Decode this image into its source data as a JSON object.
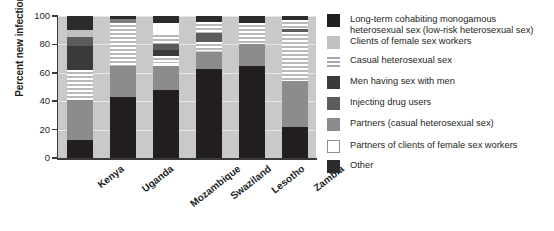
{
  "chart_data": {
    "type": "bar",
    "stacked": true,
    "title": "",
    "subtitle": "",
    "xlabel": "",
    "ylabel": "Percent new infections",
    "ylim": [
      0,
      100
    ],
    "yticks": [
      0,
      20,
      40,
      60,
      80,
      100
    ],
    "ytick_labels": [
      "0",
      "20",
      "40",
      "60",
      "80",
      "100"
    ],
    "grid": true,
    "legend_position": "right",
    "units": "percent",
    "categories": [
      "Kenya",
      "Uganda",
      "Mozambique",
      "Swaziland",
      "Lesotho",
      "Zambia"
    ],
    "series": [
      {
        "name": "Long-term cohabiting monogamous heterosexual sex (low-risk heterosexual sex)",
        "color": "#231f20",
        "pattern": "solid",
        "values": [
          13,
          43,
          48,
          63,
          65,
          22
        ]
      },
      {
        "name": "Partners (casual heterosexual sex)",
        "color": "#8c8c8c",
        "pattern": "solid",
        "values": [
          28,
          22,
          17,
          12,
          15,
          32
        ]
      },
      {
        "name": "Partners of clients of female sex workers",
        "color": "#ffffff",
        "pattern": "solid",
        "values": [
          0,
          0,
          2,
          0,
          0,
          0
        ]
      },
      {
        "name": "Casual heterosexual sex",
        "color": "#b9b9b9",
        "pattern": "horizontal-stripes",
        "values": [
          21,
          30,
          5,
          7,
          15,
          35
        ]
      },
      {
        "name": "Men having sex with men",
        "color": "#3a3a3a",
        "pattern": "solid",
        "values": [
          17,
          0,
          4,
          0,
          0,
          0
        ]
      },
      {
        "name": "Injecting drug users",
        "color": "#5c5c5c",
        "pattern": "solid",
        "values": [
          6,
          3,
          4,
          6,
          0,
          2
        ]
      },
      {
        "name": "Casual heterosexual sex (upper band)",
        "color": "#b9b9b9",
        "pattern": "horizontal-stripes",
        "values": [
          0,
          0,
          8,
          8,
          0,
          6
        ]
      },
      {
        "name": "Partners of clients of female sex workers (upper band)",
        "color": "#ffffff",
        "pattern": "solid",
        "values": [
          0,
          0,
          7,
          0,
          0,
          0
        ]
      },
      {
        "name": "Clients of female sex workers",
        "color": "#c0c0c0",
        "pattern": "solid",
        "values": [
          5,
          0,
          0,
          0,
          0,
          0
        ]
      },
      {
        "name": "Other",
        "color": "#2b2b2b",
        "pattern": "solid",
        "values": [
          10,
          2,
          5,
          4,
          5,
          3
        ]
      }
    ],
    "bars": [
      {
        "category": "Kenya",
        "segments": [
          {
            "key": "other-bottom",
            "label": "Other",
            "from": 0,
            "to": 13,
            "fill": "#231f20"
          },
          {
            "key": "partners-casual",
            "label": "Partners (casual heterosexual sex)",
            "from": 13,
            "to": 41,
            "fill": "#8c8c8c"
          },
          {
            "key": "casual-hetero",
            "label": "Casual heterosexual sex",
            "from": 41,
            "to": 62,
            "fill": "hatch"
          },
          {
            "key": "msm",
            "label": "Men having sex with men",
            "from": 62,
            "to": 79,
            "fill": "#3a3a3a"
          },
          {
            "key": "idu",
            "label": "Injecting drug users",
            "from": 79,
            "to": 85,
            "fill": "#5c5c5c"
          },
          {
            "key": "clients-fsw",
            "label": "Clients of female sex workers",
            "from": 85,
            "to": 90,
            "fill": "#c0c0c0"
          },
          {
            "key": "other-top",
            "label": "Other",
            "from": 90,
            "to": 100,
            "fill": "#2b2b2b"
          }
        ]
      },
      {
        "category": "Uganda",
        "segments": [
          {
            "key": "longterm",
            "label": "Long-term cohabiting monogamous heterosexual sex",
            "from": 0,
            "to": 43,
            "fill": "#231f20"
          },
          {
            "key": "partners-casual",
            "label": "Partners (casual heterosexual sex)",
            "from": 43,
            "to": 65,
            "fill": "#8c8c8c"
          },
          {
            "key": "casual-hetero",
            "label": "Casual heterosexual sex",
            "from": 65,
            "to": 95,
            "fill": "hatch"
          },
          {
            "key": "idu",
            "label": "Injecting drug users",
            "from": 95,
            "to": 98,
            "fill": "#7d7d7d"
          },
          {
            "key": "other-top",
            "label": "Other",
            "from": 98,
            "to": 100,
            "fill": "#2b2b2b"
          }
        ]
      },
      {
        "category": "Mozambique",
        "segments": [
          {
            "key": "longterm",
            "label": "Long-term cohabiting monogamous heterosexual sex",
            "from": 0,
            "to": 48,
            "fill": "#231f20"
          },
          {
            "key": "partners-casual",
            "label": "Partners (casual heterosexual sex)",
            "from": 48,
            "to": 65,
            "fill": "#8c8c8c"
          },
          {
            "key": "partners-clients-fsw",
            "label": "Partners of clients of female sex workers",
            "from": 65,
            "to": 67,
            "fill": "#ffffff"
          },
          {
            "key": "casual-hetero-low",
            "label": "Casual heterosexual sex",
            "from": 67,
            "to": 72,
            "fill": "hatch"
          },
          {
            "key": "msm",
            "label": "Men having sex with men",
            "from": 72,
            "to": 76,
            "fill": "#3a3a3a"
          },
          {
            "key": "idu",
            "label": "Injecting drug users",
            "from": 76,
            "to": 80,
            "fill": "#5c5c5c"
          },
          {
            "key": "casual-hetero-high",
            "label": "Casual heterosexual sex",
            "from": 80,
            "to": 88,
            "fill": "hatch"
          },
          {
            "key": "partners-clients-fsw-high",
            "label": "Partners of clients of female sex workers",
            "from": 88,
            "to": 95,
            "fill": "#ffffff"
          },
          {
            "key": "other-top",
            "label": "Other",
            "from": 95,
            "to": 100,
            "fill": "#2b2b2b"
          }
        ]
      },
      {
        "category": "Swaziland",
        "segments": [
          {
            "key": "longterm",
            "label": "Long-term cohabiting monogamous heterosexual sex",
            "from": 0,
            "to": 63,
            "fill": "#231f20"
          },
          {
            "key": "partners-casual",
            "label": "Partners (casual heterosexual sex)",
            "from": 63,
            "to": 75,
            "fill": "#8c8c8c"
          },
          {
            "key": "casual-hetero-low",
            "label": "Casual heterosexual sex",
            "from": 75,
            "to": 82,
            "fill": "hatch"
          },
          {
            "key": "idu",
            "label": "Injecting drug users",
            "from": 82,
            "to": 88,
            "fill": "#5c5c5c"
          },
          {
            "key": "casual-hetero-high",
            "label": "Casual heterosexual sex",
            "from": 88,
            "to": 96,
            "fill": "hatch"
          },
          {
            "key": "other-top",
            "label": "Other",
            "from": 96,
            "to": 100,
            "fill": "#2b2b2b"
          }
        ]
      },
      {
        "category": "Lesotho",
        "segments": [
          {
            "key": "longterm",
            "label": "Long-term cohabiting monogamous heterosexual sex",
            "from": 0,
            "to": 65,
            "fill": "#231f20"
          },
          {
            "key": "partners-casual",
            "label": "Partners (casual heterosexual sex)",
            "from": 65,
            "to": 80,
            "fill": "#8c8c8c"
          },
          {
            "key": "casual-hetero",
            "label": "Casual heterosexual sex",
            "from": 80,
            "to": 95,
            "fill": "hatch"
          },
          {
            "key": "other-top",
            "label": "Other",
            "from": 95,
            "to": 100,
            "fill": "#2b2b2b"
          }
        ]
      },
      {
        "category": "Zambia",
        "segments": [
          {
            "key": "longterm",
            "label": "Long-term cohabiting monogamous heterosexual sex",
            "from": 0,
            "to": 22,
            "fill": "#231f20"
          },
          {
            "key": "partners-casual",
            "label": "Partners (casual heterosexual sex)",
            "from": 22,
            "to": 54,
            "fill": "#8c8c8c"
          },
          {
            "key": "casual-hetero-low",
            "label": "Casual heterosexual sex",
            "from": 54,
            "to": 89,
            "fill": "hatch"
          },
          {
            "key": "idu",
            "label": "Injecting drug users",
            "from": 89,
            "to": 91,
            "fill": "#5c5c5c"
          },
          {
            "key": "casual-hetero-high",
            "label": "Casual heterosexual sex",
            "from": 91,
            "to": 97,
            "fill": "hatch"
          },
          {
            "key": "other-top",
            "label": "Other",
            "from": 97,
            "to": 100,
            "fill": "#2b2b2b"
          }
        ]
      }
    ],
    "legend": [
      {
        "label": "Long-term cohabiting monogamous\nheterosexual sex (low-risk heterosexual sex)",
        "fill": "#231f20",
        "pattern": "solid"
      },
      {
        "label": "Clients of female sex workers",
        "fill": "#c0c0c0",
        "pattern": "solid"
      },
      {
        "label": "Casual heterosexual sex",
        "fill": "#b9b9b9",
        "pattern": "horizontal-stripes"
      },
      {
        "label": "Men having sex with men",
        "fill": "#3a3a3a",
        "pattern": "solid"
      },
      {
        "label": "Injecting drug users",
        "fill": "#5c5c5c",
        "pattern": "solid"
      },
      {
        "label": "Partners (casual heterosexual sex)",
        "fill": "#8c8c8c",
        "pattern": "solid"
      },
      {
        "label": "Partners of clients of female sex workers",
        "fill": "#ffffff",
        "pattern": "solid-outlined"
      },
      {
        "label": "Other",
        "fill": "#2b2b2b",
        "pattern": "solid"
      }
    ],
    "colors": {
      "plot_background": "#c9c9c9",
      "axis": "#3a3a3a",
      "text": "#221f20",
      "page_background": "#ffffff"
    }
  }
}
